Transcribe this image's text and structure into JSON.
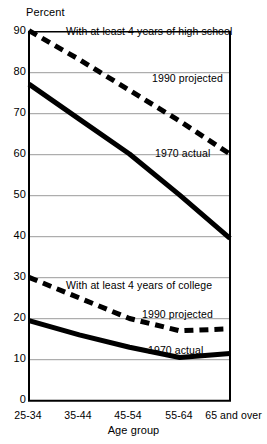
{
  "chart_data": {
    "type": "line",
    "title": "",
    "xlabel": "Age group",
    "ylabel": "Percent",
    "ylim": [
      0,
      90
    ],
    "yticks": [
      0,
      10,
      20,
      30,
      40,
      50,
      60,
      70,
      80,
      90
    ],
    "ytick_labels": [
      "0",
      "10",
      "20",
      "30",
      "40",
      "50",
      "60",
      "70",
      "80",
      "90"
    ],
    "grid": true,
    "legend": "inline-annotations",
    "categories": [
      "25-34",
      "35-44",
      "45-54",
      "55-64",
      "65 and over"
    ],
    "series": [
      {
        "name": "With at least 4 years of high school, 1990 projected",
        "style": "dashed",
        "values": [
          90,
          83,
          75.5,
          68,
          60
        ]
      },
      {
        "name": "With at least 4 years of high school, 1970 actual",
        "style": "solid",
        "values": [
          77,
          68.5,
          60,
          50,
          39.5
        ]
      },
      {
        "name": "With at least 4 years of college, 1990 projected",
        "style": "dashed",
        "values": [
          30,
          25,
          20,
          17,
          17.5
        ]
      },
      {
        "name": "With at least 4 years of college, 1970 actual",
        "style": "solid",
        "values": [
          19.5,
          16,
          13,
          10.5,
          11.5
        ]
      }
    ],
    "annotations": [
      {
        "id": "hs-group-label",
        "text": "With at least 4 years of high school",
        "x": 66,
        "y": 25
      },
      {
        "id": "hs-projected-label",
        "text": "1990 projected",
        "x": 152,
        "y": 72
      },
      {
        "id": "hs-actual-label",
        "text": "1970 actual",
        "x": 155,
        "y": 147
      },
      {
        "id": "col-group-label",
        "text": "With at least 4 years of college",
        "x": 66,
        "y": 279
      },
      {
        "id": "col-projected-label",
        "text": "1990 projected",
        "x": 142,
        "y": 308
      },
      {
        "id": "col-actual-label",
        "text": "1970 actual",
        "x": 148,
        "y": 344
      }
    ]
  },
  "axis": {
    "y_title": "Percent",
    "x_title": "Age group"
  }
}
